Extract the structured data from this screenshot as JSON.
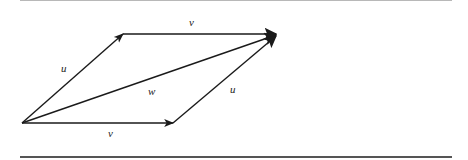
{
  "figure": {
    "stroke_color": "#1a1a1a",
    "points": {
      "origin": [
        22,
        123
      ],
      "u_tip": [
        123,
        34
      ],
      "w_tip": [
        278,
        34
      ],
      "v_tip": [
        173,
        123
      ]
    },
    "labels": {
      "top_v": "v⃗",
      "left_u": "u⃗",
      "diag_w": "w⃗",
      "right_u": "u⃗",
      "bottom_v": "v⃗"
    }
  }
}
